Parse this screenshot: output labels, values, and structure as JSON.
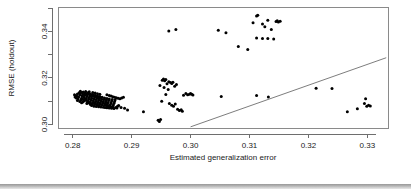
{
  "chart_data": {
    "type": "scatter",
    "title": "",
    "xlabel": "Estimated generalization error",
    "ylabel": "RMSE (holdout)",
    "xlim": [
      0.2775,
      0.3335
    ],
    "ylim": [
      0.2985,
      0.3505
    ],
    "grid": false,
    "legend": null,
    "x_ticks": [
      {
        "value": 0.28,
        "label": "0.28"
      },
      {
        "value": 0.29,
        "label": "0.29"
      },
      {
        "value": 0.3,
        "label": "0.30"
      },
      {
        "value": 0.31,
        "label": "0.31"
      },
      {
        "value": 0.32,
        "label": "0.32"
      },
      {
        "value": 0.33,
        "label": "0.33"
      }
    ],
    "y_ticks": [
      {
        "value": 0.3,
        "label": "0.30"
      },
      {
        "value": 0.31,
        "label": ""
      },
      {
        "value": 0.32,
        "label": "0.32"
      },
      {
        "value": 0.33,
        "label": ""
      },
      {
        "value": 0.34,
        "label": "0.34"
      },
      {
        "value": 0.35,
        "label": ""
      }
    ],
    "reference_line": {
      "from": [
        0.3,
        0.299
      ],
      "to": [
        0.3332,
        0.3287
      ],
      "style": "solid"
    },
    "point_radius": 1.5,
    "point_color": "#000000",
    "series": [
      {
        "name": "models",
        "points": [
          [
            0.2805,
            0.3124
          ],
          [
            0.2808,
            0.3131
          ],
          [
            0.281,
            0.3118
          ],
          [
            0.2812,
            0.3127
          ],
          [
            0.2813,
            0.3135
          ],
          [
            0.2815,
            0.3113
          ],
          [
            0.2816,
            0.3122
          ],
          [
            0.2817,
            0.313
          ],
          [
            0.2818,
            0.3108
          ],
          [
            0.2819,
            0.3117
          ],
          [
            0.282,
            0.3126
          ],
          [
            0.2821,
            0.3134
          ],
          [
            0.2822,
            0.3104
          ],
          [
            0.2823,
            0.3112
          ],
          [
            0.2824,
            0.312
          ],
          [
            0.2825,
            0.3128
          ],
          [
            0.2826,
            0.3136
          ],
          [
            0.2826,
            0.31
          ],
          [
            0.2827,
            0.3109
          ],
          [
            0.2828,
            0.3116
          ],
          [
            0.2829,
            0.3123
          ],
          [
            0.283,
            0.3131
          ],
          [
            0.283,
            0.3097
          ],
          [
            0.2831,
            0.3105
          ],
          [
            0.2832,
            0.3113
          ],
          [
            0.2833,
            0.3121
          ],
          [
            0.2834,
            0.3129
          ],
          [
            0.2834,
            0.3094
          ],
          [
            0.2835,
            0.3102
          ],
          [
            0.2836,
            0.311
          ],
          [
            0.2837,
            0.3118
          ],
          [
            0.2838,
            0.3126
          ],
          [
            0.2838,
            0.3092
          ],
          [
            0.2839,
            0.3099
          ],
          [
            0.284,
            0.3107
          ],
          [
            0.2841,
            0.3115
          ],
          [
            0.2842,
            0.3123
          ],
          [
            0.2842,
            0.3089
          ],
          [
            0.2843,
            0.3096
          ],
          [
            0.2844,
            0.3104
          ],
          [
            0.2845,
            0.3112
          ],
          [
            0.2846,
            0.312
          ],
          [
            0.2846,
            0.3087
          ],
          [
            0.2847,
            0.3094
          ],
          [
            0.2848,
            0.3101
          ],
          [
            0.2849,
            0.3109
          ],
          [
            0.285,
            0.3117
          ],
          [
            0.285,
            0.3085
          ],
          [
            0.2851,
            0.3092
          ],
          [
            0.2852,
            0.3099
          ],
          [
            0.2853,
            0.3107
          ],
          [
            0.2854,
            0.3114
          ],
          [
            0.2854,
            0.3083
          ],
          [
            0.2855,
            0.309
          ],
          [
            0.2856,
            0.3097
          ],
          [
            0.2857,
            0.3105
          ],
          [
            0.2858,
            0.3112
          ],
          [
            0.2858,
            0.3081
          ],
          [
            0.2859,
            0.3088
          ],
          [
            0.286,
            0.3095
          ],
          [
            0.2861,
            0.3103
          ],
          [
            0.2862,
            0.311
          ],
          [
            0.2863,
            0.3079
          ],
          [
            0.2864,
            0.3086
          ],
          [
            0.2865,
            0.3093
          ],
          [
            0.2866,
            0.3101
          ],
          [
            0.2867,
            0.3108
          ],
          [
            0.2868,
            0.3077
          ],
          [
            0.2869,
            0.3084
          ],
          [
            0.287,
            0.3091
          ],
          [
            0.2871,
            0.3099
          ],
          [
            0.2872,
            0.3106
          ],
          [
            0.2803,
            0.3128
          ],
          [
            0.2807,
            0.3121
          ],
          [
            0.2811,
            0.3136
          ],
          [
            0.2814,
            0.3106
          ],
          [
            0.2816,
            0.3138
          ],
          [
            0.2819,
            0.3101
          ],
          [
            0.2821,
            0.311
          ],
          [
            0.2823,
            0.3132
          ],
          [
            0.2825,
            0.3096
          ],
          [
            0.2827,
            0.3133
          ],
          [
            0.2829,
            0.3091
          ],
          [
            0.2831,
            0.3127
          ],
          [
            0.2833,
            0.3088
          ],
          [
            0.2835,
            0.3124
          ],
          [
            0.2837,
            0.3086
          ],
          [
            0.2839,
            0.3121
          ],
          [
            0.2841,
            0.3084
          ],
          [
            0.2843,
            0.3118
          ],
          [
            0.2845,
            0.3082
          ],
          [
            0.2847,
            0.3116
          ],
          [
            0.2806,
            0.3114
          ],
          [
            0.2809,
            0.311
          ],
          [
            0.2812,
            0.3099
          ],
          [
            0.2815,
            0.3094
          ],
          [
            0.2818,
            0.314
          ],
          [
            0.2822,
            0.3142
          ],
          [
            0.2826,
            0.3093
          ],
          [
            0.283,
            0.3086
          ],
          [
            0.2834,
            0.3138
          ],
          [
            0.2838,
            0.3135
          ],
          [
            0.2842,
            0.3132
          ],
          [
            0.2846,
            0.313
          ],
          [
            0.2804,
            0.3118
          ],
          [
            0.2808,
            0.3103
          ],
          [
            0.2813,
            0.3143
          ],
          [
            0.2817,
            0.3097
          ],
          [
            0.2824,
            0.309
          ],
          [
            0.2828,
            0.3141
          ],
          [
            0.2832,
            0.3082
          ],
          [
            0.2836,
            0.3079
          ],
          [
            0.284,
            0.3077
          ],
          [
            0.2844,
            0.3076
          ],
          [
            0.2848,
            0.3075
          ],
          [
            0.2852,
            0.3074
          ],
          [
            0.2855,
            0.3073
          ],
          [
            0.2858,
            0.3072
          ],
          [
            0.2862,
            0.3071
          ],
          [
            0.2866,
            0.307
          ],
          [
            0.287,
            0.3069
          ],
          [
            0.2873,
            0.3073
          ],
          [
            0.2876,
            0.3078
          ],
          [
            0.2878,
            0.3082
          ],
          [
            0.2858,
            0.3128
          ],
          [
            0.2862,
            0.3125
          ],
          [
            0.2865,
            0.3122
          ],
          [
            0.2868,
            0.3119
          ],
          [
            0.2871,
            0.3117
          ],
          [
            0.2874,
            0.3115
          ],
          [
            0.2877,
            0.3113
          ],
          [
            0.288,
            0.3111
          ],
          [
            0.2883,
            0.3114
          ],
          [
            0.2886,
            0.3117
          ],
          [
            0.2856,
            0.3086
          ],
          [
            0.286,
            0.308
          ],
          [
            0.2864,
            0.3076
          ],
          [
            0.2867,
            0.3074
          ],
          [
            0.2875,
            0.3071
          ],
          [
            0.2882,
            0.3073
          ],
          [
            0.2888,
            0.307
          ],
          [
            0.2893,
            0.3062
          ],
          [
            0.292,
            0.3055
          ],
          [
            0.2945,
            0.3018
          ],
          [
            0.2947,
            0.3013
          ],
          [
            0.2949,
            0.3021
          ],
          [
            0.2952,
            0.319
          ],
          [
            0.2954,
            0.3196
          ],
          [
            0.2956,
            0.3188
          ],
          [
            0.2958,
            0.3193
          ],
          [
            0.296,
            0.3175
          ],
          [
            0.2963,
            0.3184
          ],
          [
            0.2966,
            0.318
          ],
          [
            0.297,
            0.3182
          ],
          [
            0.2948,
            0.3168
          ],
          [
            0.2955,
            0.3159
          ],
          [
            0.2962,
            0.315
          ],
          [
            0.2958,
            0.3129
          ],
          [
            0.2951,
            0.31
          ],
          [
            0.2968,
            0.3176
          ],
          [
            0.2973,
            0.3164
          ],
          [
            0.2976,
            0.3172
          ],
          [
            0.2964,
            0.309
          ],
          [
            0.2968,
            0.3083
          ],
          [
            0.2971,
            0.3079
          ],
          [
            0.2974,
            0.3088
          ],
          [
            0.2978,
            0.3066
          ],
          [
            0.2981,
            0.306
          ],
          [
            0.2984,
            0.3063
          ],
          [
            0.2986,
            0.3057
          ],
          [
            0.2988,
            0.3126
          ],
          [
            0.2992,
            0.3133
          ],
          [
            0.2995,
            0.3128
          ],
          [
            0.2998,
            0.313
          ],
          [
            0.3,
            0.3133
          ],
          [
            0.3002,
            0.313
          ],
          [
            0.3004,
            0.3127
          ],
          [
            0.2963,
            0.3402
          ],
          [
            0.2975,
            0.3408
          ],
          [
            0.3047,
            0.3405
          ],
          [
            0.306,
            0.3394
          ],
          [
            0.3081,
            0.3335
          ],
          [
            0.3097,
            0.3322
          ],
          [
            0.3112,
            0.3466
          ],
          [
            0.3114,
            0.347
          ],
          [
            0.3106,
            0.3437
          ],
          [
            0.3122,
            0.3432
          ],
          [
            0.3131,
            0.3448
          ],
          [
            0.3145,
            0.3443
          ],
          [
            0.3147,
            0.3446
          ],
          [
            0.3149,
            0.3441
          ],
          [
            0.3152,
            0.3444
          ],
          [
            0.3126,
            0.342
          ],
          [
            0.3137,
            0.3408
          ],
          [
            0.3112,
            0.3372
          ],
          [
            0.3122,
            0.337
          ],
          [
            0.3131,
            0.337
          ],
          [
            0.3141,
            0.3368
          ],
          [
            0.3052,
            0.312
          ],
          [
            0.3112,
            0.3125
          ],
          [
            0.3132,
            0.3118
          ],
          [
            0.3213,
            0.3156
          ],
          [
            0.324,
            0.3155
          ],
          [
            0.3266,
            0.3055
          ],
          [
            0.3283,
            0.3068
          ],
          [
            0.3295,
            0.309
          ],
          [
            0.3299,
            0.3078
          ],
          [
            0.3302,
            0.3083
          ],
          [
            0.3297,
            0.3111
          ],
          [
            0.3305,
            0.308
          ]
        ]
      }
    ]
  },
  "figure": {
    "plot_area": {
      "left": 58,
      "top": 7,
      "right": 388,
      "bottom": 128
    },
    "background": "#ffffff",
    "axis_color": "#6e6e6e",
    "box_color": "#8a8a8a",
    "point_color": "#000000"
  }
}
